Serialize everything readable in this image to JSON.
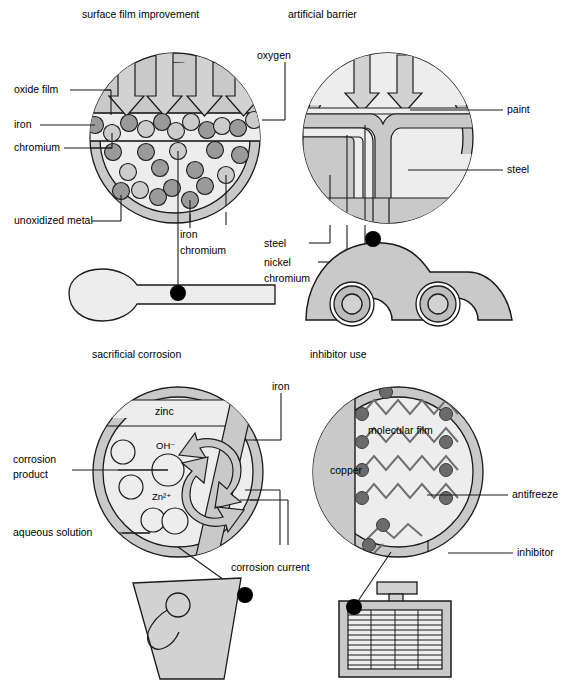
{
  "figure": {
    "width": 564,
    "height": 682
  },
  "colors": {
    "outer_ring": "#c9c9c9",
    "inner_fill": "#ededed",
    "mid_gray": "#bdbdbd",
    "dark_particle": "#9a9a9a",
    "light_particle": "#cccccc",
    "object_fill": "#d2d2d2",
    "stroke": "#1a1a1a",
    "page_bg": "#ffffff"
  },
  "panels": [
    {
      "id": "surface-film-improvement",
      "title": "surface film improvement",
      "object": "spoon",
      "labels": [
        {
          "key": "oxide_film",
          "text": "oxide film"
        },
        {
          "key": "iron",
          "text": "iron"
        },
        {
          "key": "chromium",
          "text": "chromium"
        },
        {
          "key": "unoxidized_metal",
          "text": "unoxidized metal"
        },
        {
          "key": "iron_2",
          "text": "iron"
        },
        {
          "key": "chromium_2",
          "text": "chromium"
        },
        {
          "key": "oxygen",
          "text": "oxygen"
        }
      ],
      "arrows": {
        "count": 4,
        "direction": "down",
        "meaning": "oxygen"
      },
      "particles": {
        "legend": {
          "dark": "iron",
          "light": "chromium"
        },
        "film_row_count": 13,
        "bulk_count": 18
      }
    },
    {
      "id": "artificial-barrier",
      "title": "artificial barrier",
      "object": "car",
      "labels": [
        {
          "key": "paint",
          "text": "paint"
        },
        {
          "key": "steel",
          "text": "steel"
        },
        {
          "key": "steel_2",
          "text": "steel"
        },
        {
          "key": "nickel",
          "text": "nickel"
        },
        {
          "key": "chromium",
          "text": "chromium"
        }
      ],
      "arrows": {
        "count": 2,
        "direction": "down",
        "meaning": "oxygen"
      }
    },
    {
      "id": "sacrificial-corrosion",
      "title": "sacrificial corrosion",
      "object": "bucket",
      "labels": [
        {
          "key": "zinc",
          "text": "zinc"
        },
        {
          "key": "iron",
          "text": "iron"
        },
        {
          "key": "corrosion_product",
          "text": "corrosion\nproduct"
        },
        {
          "key": "corrosion_product_l1",
          "text": "corrosion"
        },
        {
          "key": "corrosion_product_l2",
          "text": "product"
        },
        {
          "key": "aqueous_solution",
          "text": "aqueous solution"
        },
        {
          "key": "corrosion_current",
          "text": "corrosion current"
        },
        {
          "key": "hydroxide_ion",
          "text": "OH⁻"
        },
        {
          "key": "zinc_ion",
          "text": "Zn²⁺"
        }
      ],
      "arrows": {
        "count": 2,
        "direction": "circulating",
        "meaning": "corrosion current"
      }
    },
    {
      "id": "inhibitor-use",
      "title": "inhibitor use",
      "object": "radiator",
      "labels": [
        {
          "key": "copper",
          "text": "copper"
        },
        {
          "key": "molecular_film",
          "text": "molecular film"
        },
        {
          "key": "antifreeze",
          "text": "antifreeze"
        },
        {
          "key": "inhibitor",
          "text": "inhibitor"
        }
      ],
      "chains": {
        "count": 6,
        "head": "polar-head-dot"
      }
    }
  ]
}
